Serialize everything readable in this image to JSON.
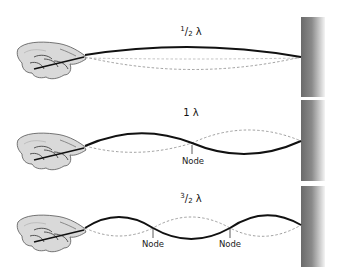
{
  "diagram": {
    "panels": [
      {
        "id": "half-wavelength",
        "label_num": "1",
        "label_den": "2",
        "label_symbol": "λ",
        "node_labels": []
      },
      {
        "id": "one-wavelength",
        "label_text": "1 λ",
        "node_labels": [
          "Node"
        ]
      },
      {
        "id": "three-half-wavelength",
        "label_num": "3",
        "label_den": "2",
        "label_symbol": "λ",
        "node_labels": [
          "Node",
          "Node"
        ]
      }
    ],
    "colors": {
      "rope": "#111111",
      "dashed": "#888888",
      "wall_dark": "#6e6e6e",
      "wall_light": "#ffffff"
    }
  }
}
